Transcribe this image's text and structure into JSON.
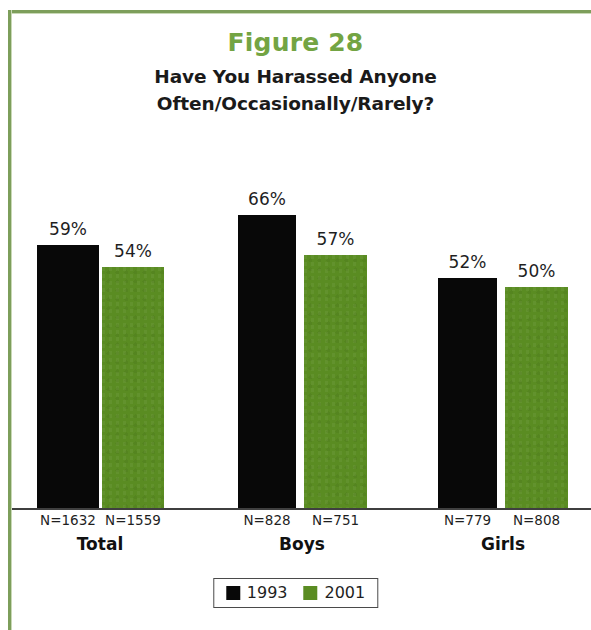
{
  "figure": {
    "title": "Figure 28",
    "subtitle_line1": "Have You Harassed Anyone",
    "subtitle_line2": "Often/Occasionally/Rarely?",
    "title_color": "#73a443",
    "frame_color": "#7d9e5b"
  },
  "legend": {
    "items": [
      {
        "label": "1993",
        "color": "#080808",
        "swatch": "square-swatch"
      },
      {
        "label": "2001",
        "color": "#5a8c22",
        "swatch": "square-swatch"
      }
    ]
  },
  "chart_data": {
    "type": "bar",
    "title": "Have You Harassed Anyone Often/Occasionally/Rarely?",
    "subtitle": "Figure 28",
    "xlabel": "",
    "ylabel": "",
    "ylim": [
      0,
      66
    ],
    "grid": false,
    "legend_position": "bottom",
    "categories": [
      "Total",
      "Boys",
      "Girls"
    ],
    "series": [
      {
        "name": "1993",
        "color": "#080808",
        "values": [
          59,
          66,
          52
        ],
        "value_labels": [
          "59%",
          "66%",
          "52%"
        ],
        "n_labels": [
          "N=1632",
          "N=828",
          "N=779"
        ]
      },
      {
        "name": "2001",
        "color": "#5a8c22",
        "values": [
          54,
          57,
          50
        ],
        "value_labels": [
          "54%",
          "57%",
          "50%"
        ],
        "n_labels": [
          "N=1559",
          "N=751",
          "N=808"
        ]
      }
    ]
  },
  "bars": [
    {
      "value_label": "59%",
      "n_label": "N=1632",
      "series": "1993",
      "group": "Total",
      "left": 37,
      "width": 62,
      "top": 245
    },
    {
      "value_label": "54%",
      "n_label": "N=1559",
      "series": "2001",
      "group": "Total",
      "left": 102,
      "width": 62,
      "top": 267
    },
    {
      "value_label": "66%",
      "n_label": "N=828",
      "series": "1993",
      "group": "Boys",
      "left": 238,
      "width": 58,
      "top": 215
    },
    {
      "value_label": "57%",
      "n_label": "N=751",
      "series": "2001",
      "group": "Boys",
      "left": 304,
      "width": 63,
      "top": 255
    },
    {
      "value_label": "52%",
      "n_label": "N=779",
      "series": "1993",
      "group": "Girls",
      "left": 438,
      "width": 59,
      "top": 278
    },
    {
      "value_label": "50%",
      "n_label": "N=808",
      "series": "2001",
      "group": "Girls",
      "left": 505,
      "width": 63,
      "top": 287
    }
  ],
  "groups": [
    {
      "label": "Total",
      "center": 100
    },
    {
      "label": "Boys",
      "center": 302
    },
    {
      "label": "Girls",
      "center": 503
    }
  ]
}
